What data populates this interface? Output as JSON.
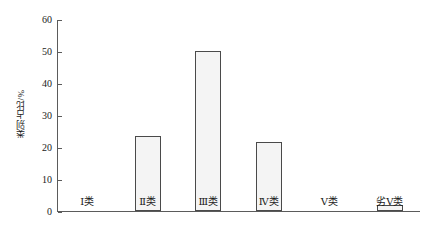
{
  "chart_data": {
    "type": "bar",
    "title": "",
    "xlabel": "",
    "ylabel": "类别占比/%",
    "categories": [
      "Ⅰ类",
      "Ⅱ类",
      "Ⅲ类",
      "Ⅳ类",
      "Ⅴ类",
      "劣Ⅴ类"
    ],
    "values": [
      0,
      23.4,
      50,
      21.5,
      0,
      2
    ],
    "ylim": [
      0,
      60
    ],
    "ytick_values": [
      0,
      10,
      20,
      30,
      40,
      50,
      60
    ],
    "ytick_labels": [
      "0",
      "10",
      "20",
      "30",
      "40",
      "50",
      "60"
    ],
    "grid": false,
    "legend": false,
    "legend_position": "none",
    "bar_fill_color": "#f4f4f4",
    "bar_edge_color": "#4a4a4a",
    "axis_color": "#5b5b5b",
    "text_color": "#1a1a1a"
  }
}
